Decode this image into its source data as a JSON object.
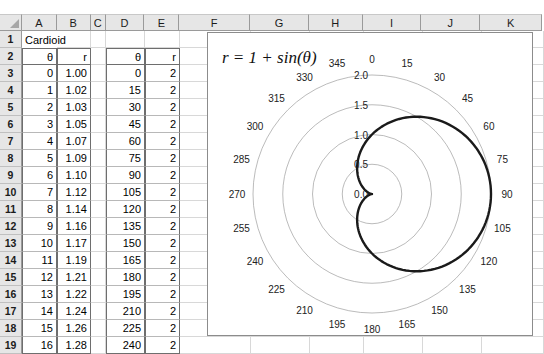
{
  "spreadsheet": {
    "column_headers": [
      "A",
      "B",
      "C",
      "D",
      "E",
      "F",
      "G",
      "H",
      "I",
      "J",
      "K"
    ],
    "row_headers": [
      "1",
      "2",
      "3",
      "4",
      "5",
      "6",
      "7",
      "8",
      "9",
      "10",
      "11",
      "12",
      "13",
      "14",
      "15",
      "16",
      "17",
      "18",
      "19"
    ],
    "title_cell": "Cardioid",
    "headers": {
      "a": "θ",
      "b": "r",
      "d": "θ",
      "e": "r"
    },
    "rows": [
      {
        "a": "0",
        "b": "1.00",
        "d": "0",
        "e": "2"
      },
      {
        "a": "1",
        "b": "1.02",
        "d": "15",
        "e": "2"
      },
      {
        "a": "2",
        "b": "1.03",
        "d": "30",
        "e": "2"
      },
      {
        "a": "3",
        "b": "1.05",
        "d": "45",
        "e": "2"
      },
      {
        "a": "4",
        "b": "1.07",
        "d": "60",
        "e": "2"
      },
      {
        "a": "5",
        "b": "1.09",
        "d": "75",
        "e": "2"
      },
      {
        "a": "6",
        "b": "1.10",
        "d": "90",
        "e": "2"
      },
      {
        "a": "7",
        "b": "1.12",
        "d": "105",
        "e": "2"
      },
      {
        "a": "8",
        "b": "1.14",
        "d": "120",
        "e": "2"
      },
      {
        "a": "9",
        "b": "1.16",
        "d": "135",
        "e": "2"
      },
      {
        "a": "10",
        "b": "1.17",
        "d": "150",
        "e": "2"
      },
      {
        "a": "11",
        "b": "1.19",
        "d": "165",
        "e": "2"
      },
      {
        "a": "12",
        "b": "1.21",
        "d": "180",
        "e": "2"
      },
      {
        "a": "13",
        "b": "1.22",
        "d": "195",
        "e": "2"
      },
      {
        "a": "14",
        "b": "1.24",
        "d": "210",
        "e": "2"
      },
      {
        "a": "15",
        "b": "1.26",
        "d": "225",
        "e": "2"
      },
      {
        "a": "16",
        "b": "1.28",
        "d": "240",
        "e": "2"
      }
    ]
  },
  "chart_data": {
    "type": "line",
    "projection": "polar",
    "title": "r = 1 + sin(θ)",
    "equation": "r = 1 + sin(θ)",
    "xlabel": "",
    "ylabel": "",
    "grid": true,
    "legend": false,
    "angle_direction": "clockwise",
    "angle_zero_at": "top",
    "angle_unit": "degrees",
    "angle_ticks": [
      0,
      15,
      30,
      45,
      60,
      75,
      90,
      105,
      120,
      135,
      150,
      165,
      180,
      195,
      210,
      225,
      240,
      255,
      270,
      285,
      300,
      315,
      330,
      345
    ],
    "radial_ticks": [
      0.0,
      0.5,
      1.0,
      1.5,
      2.0
    ],
    "radial_tick_labels": [
      "0.0",
      "0.5",
      "1.0",
      "1.5",
      "2.0"
    ],
    "rlim": [
      0,
      2.0
    ],
    "series": [
      {
        "name": "r = 1 + sin(θ)",
        "color": "#1a1a1a",
        "theta_deg": [
          0,
          15,
          30,
          45,
          60,
          75,
          90,
          105,
          120,
          135,
          150,
          165,
          180,
          195,
          210,
          225,
          240,
          255,
          270,
          285,
          300,
          315,
          330,
          345,
          360
        ],
        "r": [
          1.0,
          1.26,
          1.5,
          1.71,
          1.87,
          1.97,
          2.0,
          1.97,
          1.87,
          1.71,
          1.5,
          1.26,
          1.0,
          0.74,
          0.5,
          0.29,
          0.13,
          0.03,
          0.0,
          0.03,
          0.13,
          0.29,
          0.5,
          0.74,
          1.0
        ]
      }
    ]
  }
}
